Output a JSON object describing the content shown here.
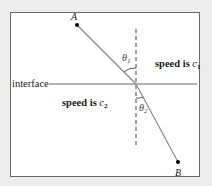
{
  "diagram": {
    "points": {
      "A": {
        "label": "A"
      },
      "B": {
        "label": "B"
      }
    },
    "interface_label": "interface",
    "regions": {
      "top": {
        "text": "speed is ",
        "var": "c",
        "sub": "1"
      },
      "bottom": {
        "text": "speed is ",
        "var": "c",
        "sub": "2"
      }
    },
    "angles": {
      "theta1": {
        "symbol": "θ",
        "sub": "1"
      },
      "theta2": {
        "symbol": "θ",
        "sub": "2"
      }
    },
    "colors": {
      "ray": "#8a8a8a",
      "frame": "#6a6a6a",
      "background": "#ececec",
      "text": "#1a1a1a"
    }
  }
}
